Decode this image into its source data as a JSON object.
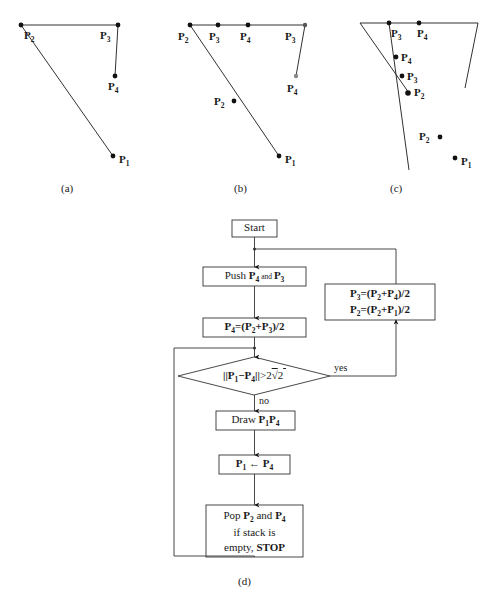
{
  "figure": {
    "caption_a": "(a)",
    "caption_b": "(b)",
    "caption_c": "(c)",
    "caption_d": "(d)"
  },
  "panel_a": {
    "name": "subdivision-step-a",
    "labels": [
      {
        "id": "p2",
        "text": "P",
        "sub": "2"
      },
      {
        "id": "p3",
        "text": "P",
        "sub": "3"
      },
      {
        "id": "p4",
        "text": "P",
        "sub": "4"
      },
      {
        "id": "p1",
        "text": "P",
        "sub": "1"
      }
    ]
  },
  "panel_b": {
    "name": "subdivision-step-b",
    "labels": [
      {
        "id": "p2-top",
        "text": "P",
        "sub": "2"
      },
      {
        "id": "p3-mid1",
        "text": "P",
        "sub": "3"
      },
      {
        "id": "p4-mid",
        "text": "P",
        "sub": "4"
      },
      {
        "id": "p3-right",
        "text": "P",
        "sub": "3"
      },
      {
        "id": "p4-low",
        "text": "P",
        "sub": "4"
      },
      {
        "id": "p2-mid",
        "text": "P",
        "sub": "2"
      },
      {
        "id": "p1",
        "text": "P",
        "sub": "1"
      }
    ]
  },
  "panel_c": {
    "name": "subdivision-step-c",
    "labels": [
      {
        "id": "p3-top",
        "text": "P",
        "sub": "3"
      },
      {
        "id": "p4-top",
        "text": "P",
        "sub": "4"
      },
      {
        "id": "p4-second",
        "text": "P",
        "sub": "4"
      },
      {
        "id": "p3-second",
        "text": "P",
        "sub": "3"
      },
      {
        "id": "p2-upper",
        "text": "P",
        "sub": "2"
      },
      {
        "id": "p2-lower",
        "text": "P",
        "sub": "2"
      },
      {
        "id": "p1",
        "text": "P",
        "sub": "1"
      }
    ]
  },
  "flowchart": {
    "start": "Start",
    "push": {
      "prefix": "Push ",
      "a": "P",
      "a_sub": "4",
      "joiner": " and ",
      "b": "P",
      "b_sub": "3"
    },
    "assign_p4": "P4=(P2+P3)/2",
    "update_box_line1": "P3=(P2+P4)/2",
    "update_box_line2": "P2=(P2+P1)/2",
    "decision": "||P1−P4||>2√2",
    "yes_label": "yes",
    "no_label": "no",
    "draw": "Draw P1P4",
    "assign_p1": "P1 ← P4",
    "pop_line1": "Pop P2 and P4",
    "pop_line2": "if stack is",
    "pop_line3a": "empty, ",
    "pop_line3b": "STOP"
  },
  "colors": {
    "stroke": "#1a1a1a",
    "box_border": "#333333",
    "background": "#ffffff"
  }
}
